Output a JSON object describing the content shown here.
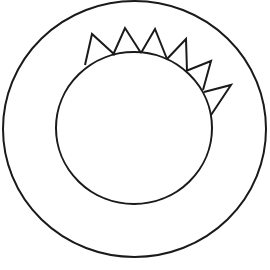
{
  "diagram": {
    "background": "#ffffff",
    "stroke_color": "#1a1a1a",
    "stroke_width": 2,
    "outer_circle": {
      "cx": 134.5,
      "cy": 129,
      "rx": 131.5,
      "ry": 128
    },
    "inner_circle": {
      "cx": 134,
      "cy": 128,
      "rx": 78,
      "ry": 76
    },
    "spikes": [
      {
        "points": "85,65 92,34 115,55"
      },
      {
        "points": "113,55 125,28 141,53"
      },
      {
        "points": "141,53 155,29 167,59"
      },
      {
        "points": "167,59 186,39 187,71"
      },
      {
        "points": "186,71 211,61 203,90"
      },
      {
        "points": "204,92 231,85 211,115"
      }
    ]
  }
}
